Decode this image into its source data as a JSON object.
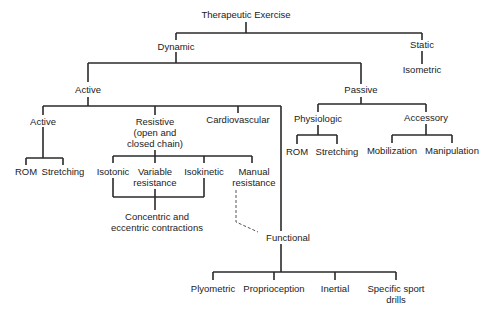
{
  "diagram": {
    "title": "Therapeutic Exercise",
    "nodes": {
      "root": "Therapeutic Exercise",
      "dynamic": "Dynamic",
      "static": "Static",
      "isometric": "Isometric",
      "active_top": "Active",
      "passive": "Passive",
      "active_sub": "Active",
      "resistive": [
        "Resistive",
        "(open and",
        "closed chain)"
      ],
      "cardiovascular": "Cardiovascular",
      "physiologic": "Physiologic",
      "accessory": "Accessory",
      "rom_active": "ROM",
      "stretching_active": "Stretching",
      "isotonic": "Isotonic",
      "variable_resistance": [
        "Variable",
        "resistance"
      ],
      "isokinetic": "Isokinetic",
      "manual_resistance": [
        "Manual",
        "resistance"
      ],
      "rom_passive": "ROM",
      "stretching_passive": "Stretching",
      "mobilization": "Mobilization",
      "manipulation": "Manipulation",
      "concentric_eccentric": [
        "Concentric and",
        "eccentric contractions"
      ],
      "functional": "Functional",
      "plyometric": "Plyometric",
      "proprioception": "Proprioception",
      "inertial": "Inertial",
      "specific_sport_drills": [
        "Specific sport",
        "drills"
      ]
    },
    "colors": {
      "line": "#2a2a2a",
      "text": "#222222",
      "background": "#ffffff"
    }
  }
}
